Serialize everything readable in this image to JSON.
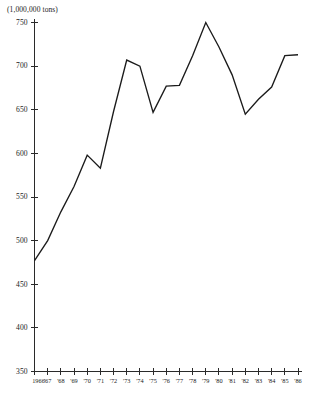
{
  "chart_data": {
    "type": "line",
    "title": "",
    "unit_label": "(1,000,000 tons)",
    "xlabel": "",
    "ylabel": "",
    "ylim": [
      350,
      750
    ],
    "ytick_values": [
      750,
      700,
      650,
      600,
      550,
      500,
      450,
      400,
      350
    ],
    "ytick_labels": [
      "750",
      "700",
      "650",
      "600",
      "550",
      "500",
      "450",
      "400",
      "350"
    ],
    "grid": false,
    "legend": "none",
    "x": [
      1966,
      1967,
      1968,
      1969,
      1970,
      1971,
      1972,
      1973,
      1974,
      1975,
      1976,
      1977,
      1978,
      1979,
      1980,
      1981,
      1982,
      1983,
      1984,
      1985,
      1986
    ],
    "categories": [
      "1966",
      "'67",
      "'68",
      "'69",
      "'70",
      "'71",
      "'72",
      "'73",
      "'74",
      "'75",
      "'76",
      "'77",
      "'78",
      "'79",
      "'80",
      "'81",
      "'82",
      "'83",
      "'84",
      "'85",
      "'86"
    ],
    "values": [
      477,
      500,
      533,
      562,
      598,
      583,
      648,
      707,
      700,
      647,
      677,
      678,
      712,
      750,
      722,
      690,
      645,
      662,
      676,
      712,
      713
    ],
    "series": [
      {
        "name": "production",
        "values": [
          477,
          500,
          533,
          562,
          598,
          583,
          648,
          707,
          700,
          647,
          677,
          678,
          712,
          750,
          722,
          690,
          645,
          662,
          676,
          712,
          713
        ]
      }
    ]
  }
}
